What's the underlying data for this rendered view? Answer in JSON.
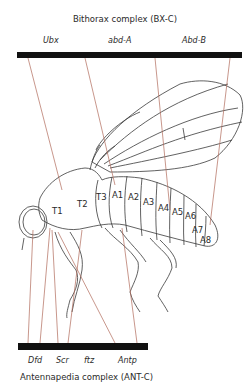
{
  "top_complex": {
    "title": "Bithorax complex (BX-C)",
    "genes": [
      "Ubx",
      "abd-A",
      "Abd-B"
    ]
  },
  "bottom_complex": {
    "title": "Antennapedia complex (ANT-C)",
    "genes": [
      "Dfd",
      "Scr",
      "ftz",
      "Antp"
    ]
  },
  "segments": [
    "T1",
    "T2",
    "T3",
    "A1",
    "A2",
    "A3",
    "A4",
    "A5",
    "A6",
    "A7",
    "A8"
  ],
  "colors": {
    "bar": "#111111",
    "mapping_line": "#b06a5a",
    "outline": "#3a3a3a"
  }
}
